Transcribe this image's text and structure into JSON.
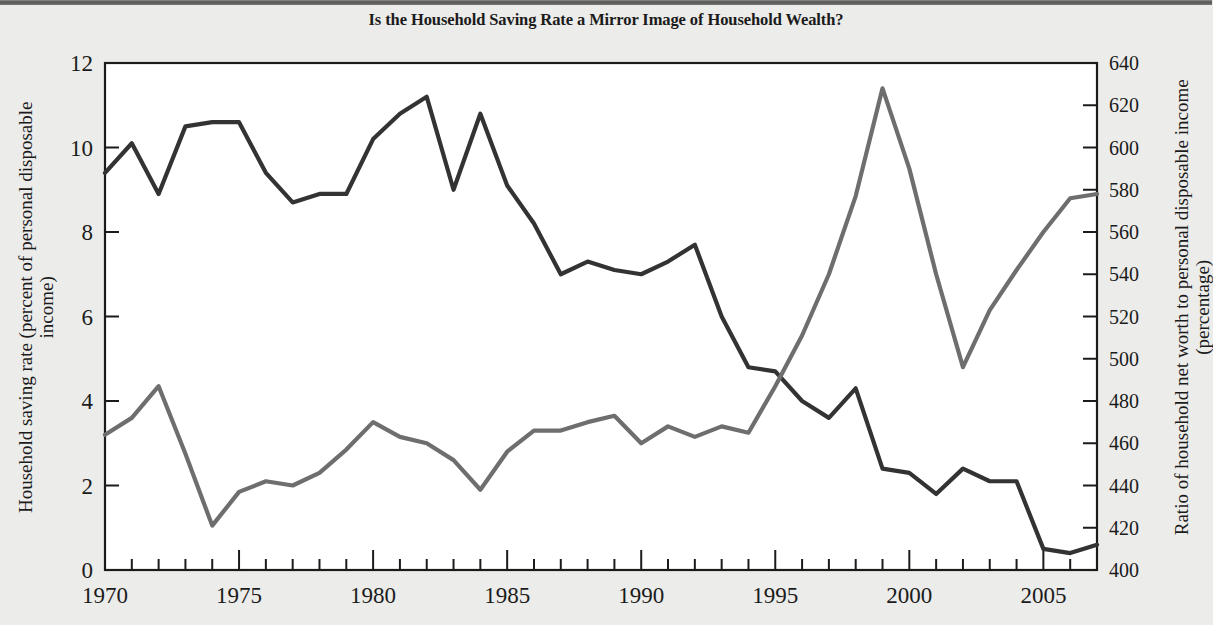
{
  "title": "Is the Household Saving Rate a Mirror Image of Household Wealth?",
  "axes": {
    "left_title": "Household saving rate (percent of personal disposable\nincome)",
    "right_title": "Ratio of household net worth to personal disposable income\n(percentage)",
    "x_title": "",
    "left_ticks": [
      "0",
      "2",
      "4",
      "6",
      "8",
      "10",
      "12"
    ],
    "right_ticks": [
      "400",
      "420",
      "440",
      "460",
      "480",
      "500",
      "520",
      "540",
      "560",
      "580",
      "600",
      "620",
      "640"
    ],
    "x_ticks": [
      "1970",
      "1975",
      "1980",
      "1985",
      "1990",
      "1995",
      "2000",
      "2005"
    ]
  },
  "annotations": {
    "saving": "Household saving rate\n(left scale)",
    "wealth": "Household net worth/\npersonal disposable income\n(right scale)"
  },
  "colors": {
    "saving_line": "#333333",
    "wealth_line": "#6e6e6e",
    "plot_background": "#ffffff",
    "page_background": "#ececea",
    "frame": "#1b1b1b"
  },
  "chart_data": {
    "type": "line",
    "title": "Is the Household Saving Rate a Mirror Image of Household Wealth?",
    "xlabel": "",
    "ylabel": "Household saving rate (percent of personal disposable income)",
    "y2label": "Ratio of household net worth to personal disposable income (percentage)",
    "grid": false,
    "legend": "annotations-inline",
    "xlim": [
      1970,
      2007
    ],
    "ylim": [
      0,
      12
    ],
    "y2lim": [
      400,
      640
    ],
    "x": [
      1970,
      1971,
      1972,
      1973,
      1974,
      1975,
      1976,
      1977,
      1978,
      1979,
      1980,
      1981,
      1982,
      1983,
      1984,
      1985,
      1986,
      1987,
      1988,
      1989,
      1990,
      1991,
      1992,
      1993,
      1994,
      1995,
      1996,
      1997,
      1998,
      1999,
      2000,
      2001,
      2002,
      2003,
      2004,
      2005,
      2006,
      2007
    ],
    "series": [
      {
        "name": "Household saving rate (left scale)",
        "axis": "left",
        "color": "#333333",
        "values": [
          9.4,
          10.1,
          8.9,
          10.5,
          10.6,
          10.6,
          9.4,
          8.7,
          8.9,
          8.9,
          10.2,
          10.8,
          11.2,
          9.0,
          10.8,
          9.1,
          8.2,
          7.0,
          7.3,
          7.1,
          7.0,
          7.3,
          7.7,
          6.0,
          4.8,
          4.7,
          4.0,
          3.6,
          4.3,
          2.4,
          2.3,
          1.8,
          2.4,
          2.1,
          2.1,
          0.5,
          0.4,
          0.6
        ]
      },
      {
        "name": "Household net worth/personal disposable income (right scale)",
        "axis": "right",
        "color": "#6e6e6e",
        "values": [
          464,
          472,
          487,
          455,
          421,
          437,
          442,
          440,
          446,
          457,
          470,
          463,
          460,
          452,
          438,
          456,
          466,
          466,
          470,
          473,
          460,
          468,
          463,
          468,
          465,
          487,
          511,
          540,
          577,
          628,
          590,
          540,
          496,
          523,
          542,
          560,
          576,
          578
        ]
      }
    ]
  }
}
